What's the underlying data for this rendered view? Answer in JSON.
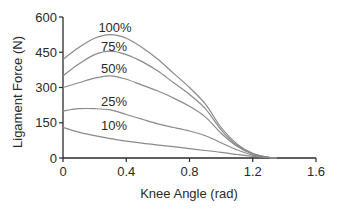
{
  "chart_data": {
    "type": "line",
    "title": "",
    "xlabel": "Knee Angle (rad)",
    "ylabel": "Ligament Force (N)",
    "xlim": [
      0,
      1.6
    ],
    "ylim": [
      0,
      600
    ],
    "xticks": [
      "0",
      "0.4",
      "0.8",
      "1.2",
      "1.6"
    ],
    "yticks": [
      "0",
      "150",
      "300",
      "450",
      "600"
    ],
    "grid": false,
    "legend": "inline labels",
    "x": [
      0,
      0.1,
      0.2,
      0.3,
      0.4,
      0.5,
      0.6,
      0.7,
      0.8,
      0.9,
      1.0,
      1.1,
      1.2,
      1.3,
      1.35
    ],
    "series": [
      {
        "name": "100%",
        "values": [
          420,
          470,
          510,
          525,
          510,
          470,
          420,
          360,
          300,
          230,
          130,
          60,
          20,
          3,
          0
        ]
      },
      {
        "name": "75%",
        "values": [
          350,
          400,
          440,
          455,
          440,
          410,
          370,
          320,
          270,
          210,
          120,
          55,
          18,
          3,
          0
        ]
      },
      {
        "name": "50%",
        "values": [
          300,
          320,
          340,
          350,
          335,
          310,
          285,
          255,
          220,
          175,
          105,
          50,
          16,
          2,
          0
        ]
      },
      {
        "name": "25%",
        "values": [
          200,
          210,
          210,
          205,
          185,
          165,
          145,
          130,
          115,
          95,
          65,
          35,
          12,
          2,
          0
        ]
      },
      {
        "name": "10%",
        "values": [
          130,
          110,
          95,
          82,
          72,
          63,
          55,
          48,
          40,
          32,
          24,
          15,
          7,
          2,
          0
        ]
      }
    ],
    "line_color": "#8a8a8a",
    "axis_color": "#2a2a2a"
  }
}
